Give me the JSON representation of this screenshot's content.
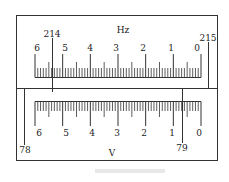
{
  "diagram": {
    "type": "dual-scale-meter",
    "top_panel": {
      "unit": "Hz",
      "tick_labels": [
        "6",
        "5",
        "4",
        "3",
        "2",
        "1",
        "0"
      ],
      "markers": [
        {
          "label": "214",
          "position": "left, between 6 and 5"
        },
        {
          "label": "215",
          "position": "right edge, beyond 0"
        }
      ]
    },
    "bottom_panel": {
      "unit": "V",
      "tick_labels": [
        "6",
        "5",
        "4",
        "3",
        "2",
        "1",
        "0"
      ],
      "markers": [
        {
          "label": "78",
          "position": "left edge, before 6"
        },
        {
          "label": "79",
          "position": "right, between 1 and 0"
        }
      ]
    }
  },
  "labels": {
    "hz": "Hz",
    "v": "V",
    "m214": "214",
    "m215": "215",
    "m78": "78",
    "m79": "79",
    "top_ticks": [
      "6",
      "5",
      "4",
      "3",
      "2",
      "1",
      "0"
    ],
    "bottom_ticks": [
      "6",
      "5",
      "4",
      "3",
      "2",
      "1",
      "0"
    ]
  },
  "colors": {
    "line": "#333333",
    "text": "#222222",
    "background": "#ffffff"
  }
}
